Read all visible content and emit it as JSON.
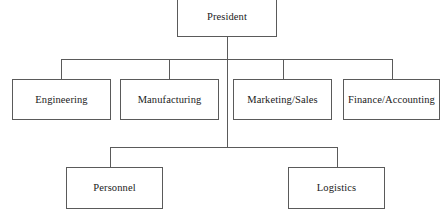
{
  "chart": {
    "type": "org-chart",
    "line_color": "#5a5a5a",
    "box_fill": "#ffffff",
    "text_color": "#1a1a1a",
    "nodes": {
      "president": {
        "label": "President",
        "level": 1
      },
      "engineering": {
        "label": "Engineering",
        "level": 2
      },
      "manufacturing": {
        "label": "Manufacturing",
        "level": 2
      },
      "marketing_sales": {
        "label": "Marketing/Sales",
        "level": 2
      },
      "finance_accounting": {
        "label": "Finance/Accounting",
        "level": 2
      },
      "personnel": {
        "label": "Personnel",
        "level": 3
      },
      "logistics": {
        "label": "Logistics",
        "level": 3
      }
    },
    "hierarchy": [
      {
        "parent": "president",
        "children": [
          "engineering",
          "manufacturing",
          "marketing_sales",
          "finance_accounting",
          "personnel",
          "logistics"
        ]
      }
    ]
  }
}
